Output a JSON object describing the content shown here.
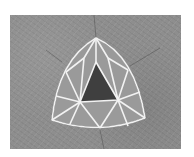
{
  "image": {
    "subject": "trillion-cut gemstone",
    "background": "gray textured surface",
    "colors": {
      "background": "#8e8e8e",
      "margin": "#ffffff",
      "facet_lines": "#f2f2f2",
      "gem_dark": "#3a3a3a"
    }
  }
}
